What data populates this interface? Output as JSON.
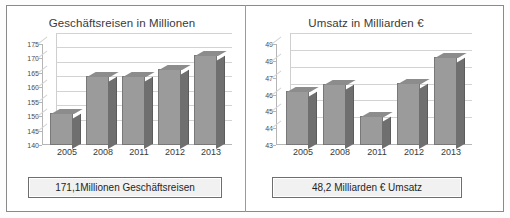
{
  "document": {
    "title": "Geschäftsreisen und Umsatz 2005-2013"
  },
  "panels": {
    "left": {
      "title": "Geschäftsreisen in Millionen",
      "caption": "171,1Millionen Geschäftsreisen"
    },
    "right": {
      "title": "Umsatz in Milliarden €",
      "caption": "48,2 Milliarden € Umsatz"
    }
  },
  "chart_data": [
    {
      "type": "bar",
      "title": "Geschäftsreisen in Millionen",
      "xlabel": "",
      "ylabel": "",
      "categories": [
        "2005",
        "2008",
        "2011",
        "2012",
        "2013"
      ],
      "values": [
        151.0,
        163.9,
        163.8,
        166.4,
        171.1
      ],
      "ylim": [
        140,
        175
      ],
      "yticks": [
        140,
        145,
        150,
        155,
        160,
        165,
        170,
        175
      ],
      "grid": true,
      "legend": false,
      "annotation": "171,1Millionen Geschäftsreisen"
    },
    {
      "type": "bar",
      "title": "Umsatz in Milliarden €",
      "xlabel": "",
      "ylabel": "",
      "categories": [
        "2005",
        "2008",
        "2011",
        "2012",
        "2013"
      ],
      "values": [
        46.2,
        46.6,
        44.7,
        46.7,
        48.2
      ],
      "ylim": [
        43,
        49
      ],
      "yticks": [
        43,
        44,
        45,
        46,
        47,
        48,
        49
      ],
      "grid": true,
      "legend": false,
      "annotation": "48,2 Milliarden € Umsatz"
    }
  ]
}
